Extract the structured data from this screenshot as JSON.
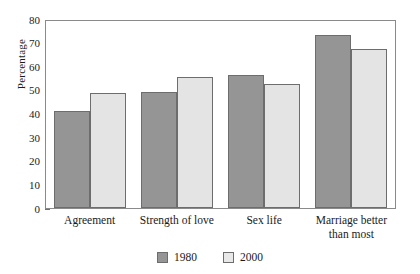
{
  "chart_data": {
    "type": "bar",
    "title": "",
    "xlabel": "",
    "ylabel": "Percentage",
    "ylim": [
      0,
      80
    ],
    "yticks": [
      0,
      10,
      20,
      30,
      40,
      50,
      60,
      70,
      80
    ],
    "ytick_labels": [
      "0",
      "10",
      "20",
      "30",
      "40",
      "50",
      "60",
      "70",
      "80"
    ],
    "grid": false,
    "legend_position": "bottom-center",
    "categories": [
      "Agreement",
      "Strength of love",
      "Sex life",
      "Marriage better\nthan most"
    ],
    "category_labels": [
      {
        "line1": "Agreement",
        "line2": ""
      },
      {
        "line1": "Strength of love",
        "line2": ""
      },
      {
        "line1": "Sex life",
        "line2": ""
      },
      {
        "line1": "Marriage better",
        "line2": "than most"
      }
    ],
    "series": [
      {
        "name": "1980",
        "color": "#959595",
        "values": [
          41.5,
          49.5,
          57,
          74
        ]
      },
      {
        "name": "2000",
        "color": "#e4e4e4",
        "values": [
          49,
          56,
          53,
          68
        ]
      }
    ]
  },
  "legend": {
    "items": [
      {
        "label": "1980",
        "swatch": "dark-gray-swatch"
      },
      {
        "label": "2000",
        "swatch": "light-gray-swatch"
      }
    ]
  }
}
